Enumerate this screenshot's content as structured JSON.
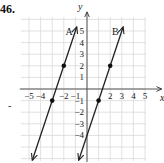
{
  "problem": {
    "number": "46."
  },
  "chart_data": {
    "type": "line",
    "title": "",
    "xlabel": "x",
    "ylabel": "y",
    "xlim": [
      -5.8,
      5.8
    ],
    "ylim": [
      -6.3,
      6.3
    ],
    "grid": true,
    "x_ticks": [
      "-5",
      "-4",
      "-2",
      "-1",
      "2",
      "3",
      "4",
      "5"
    ],
    "y_ticks": [
      "5",
      "4",
      "3",
      "2",
      "1",
      "-1",
      "-2",
      "-3",
      "-4"
    ],
    "series": [
      {
        "name": "A",
        "equation": "y = 3x + 8",
        "marked_points": [
          [
            -2,
            2
          ],
          [
            -3,
            -1
          ]
        ],
        "endpoints": [
          [
            -4.7,
            -6.1
          ],
          [
            -0.9,
            5.3
          ]
        ],
        "arrows": "both"
      },
      {
        "name": "B",
        "equation": "y = 3x - 4",
        "marked_points": [
          [
            2,
            2
          ],
          [
            1,
            -1
          ]
        ],
        "endpoints": [
          [
            -0.7,
            -6.1
          ],
          [
            3.1,
            5.3
          ]
        ],
        "arrows": "both"
      }
    ],
    "colors": {
      "grid": "#d9d9d9",
      "axis": "#555555",
      "line": "#222222",
      "point": "#111111"
    }
  },
  "labels": {
    "x_axis": "x",
    "y_axis": "y",
    "line_a": "A",
    "line_b": "B",
    "stray_mark": "-"
  }
}
